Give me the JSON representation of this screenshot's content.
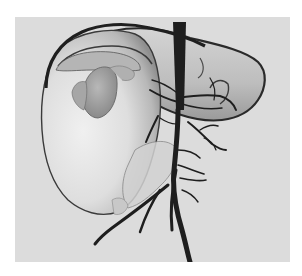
{
  "image": {
    "subject": "3D surface rendering of a liver with hepatic vasculature",
    "structures": [
      {
        "id": "liver",
        "label": "Liver parenchyma (translucent surface)"
      },
      {
        "id": "gallbladder",
        "label": "Gallbladder"
      },
      {
        "id": "ivc",
        "label": "Inferior vena cava"
      },
      {
        "id": "portal-vein",
        "label": "Portal venous tree"
      },
      {
        "id": "hepatic-veins",
        "label": "Hepatic veins"
      }
    ]
  },
  "colors": {
    "page_background": "#ffffff",
    "viewport_background": "#dcdcdc",
    "liver_light": "#e9e9e9",
    "liver_mid": "#c4c4c4",
    "liver_shadow": "#8a8a8a",
    "liver_outline": "#2a2a2a",
    "vessel_dark": "#1e1e1e",
    "gallbladder": "#9e9e9e"
  }
}
